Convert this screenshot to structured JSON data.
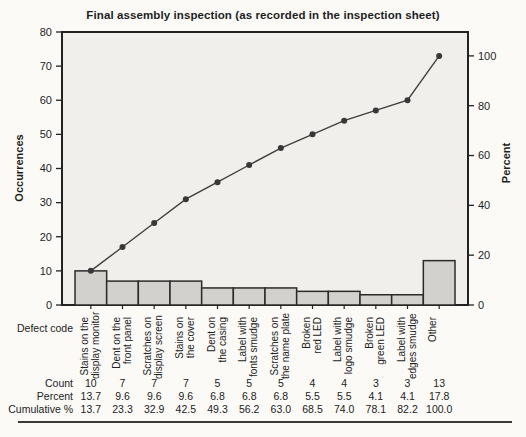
{
  "title": "Final assembly inspection (as recorded in the inspection sheet)",
  "chart_data": {
    "type": "bar",
    "subtype": "pareto-with-cumulative-line",
    "title": "Final assembly inspection (as recorded in the inspection sheet)",
    "categories": [
      [
        "Stains on the",
        "display monitor"
      ],
      [
        "Dent on the",
        "front panel"
      ],
      [
        "Scratches on",
        "display screen"
      ],
      [
        "Stains on",
        "the cover"
      ],
      [
        "Dent on",
        "the casing"
      ],
      [
        "Label with",
        "fonts smudge"
      ],
      [
        "Scratches on",
        "the name plate"
      ],
      [
        "Broken",
        "red LED"
      ],
      [
        "Label with",
        "logo smudge"
      ],
      [
        "Broken",
        "green LED"
      ],
      [
        "Label with",
        "edges smudge"
      ],
      [
        "Other"
      ]
    ],
    "counts": [
      10,
      7,
      7,
      7,
      5,
      5,
      5,
      4,
      4,
      3,
      3,
      13
    ],
    "percents": [
      13.7,
      9.6,
      9.6,
      9.6,
      6.8,
      6.8,
      6.8,
      5.5,
      5.5,
      4.1,
      4.1,
      17.8
    ],
    "cumulative": [
      13.7,
      23.3,
      32.9,
      42.5,
      49.3,
      56.2,
      63.0,
      68.5,
      74.0,
      78.1,
      82.2,
      100.0
    ],
    "total": 73,
    "left_axis": {
      "label": "Occurrences",
      "ticks": [
        0,
        10,
        20,
        30,
        40,
        50,
        60,
        70,
        80
      ],
      "max": 80
    },
    "right_axis": {
      "label": "Percent",
      "ticks": [
        0,
        20,
        40,
        60,
        80,
        100
      ]
    },
    "x_axis_label": "Defect code",
    "grid": false,
    "legend": "none"
  },
  "table": {
    "rows": [
      {
        "label": "Count",
        "values": [
          "10",
          "7",
          "7",
          "7",
          "5",
          "5",
          "5",
          "4",
          "4",
          "3",
          "3",
          "13"
        ]
      },
      {
        "label": "Percent",
        "values": [
          "13.7",
          "9.6",
          "9.6",
          "9.6",
          "6.8",
          "6.8",
          "6.8",
          "5.5",
          "5.5",
          "4.1",
          "4.1",
          "17.8"
        ]
      },
      {
        "label": "Cumulative %",
        "values": [
          "13.7",
          "23.3",
          "32.9",
          "42.5",
          "49.3",
          "56.2",
          "63.0",
          "68.5",
          "74.0",
          "78.1",
          "82.2",
          "100.0"
        ]
      }
    ]
  },
  "colors": {
    "page_bg": "#fbfaf7",
    "plot_bg": "#f0efec",
    "bar_fill": "#d2d1ce",
    "bar_border": "#2b2b2b",
    "axis_border": "#222222",
    "line": "#3f3f3f",
    "marker": "#383838",
    "text": "#1e1e1e"
  }
}
